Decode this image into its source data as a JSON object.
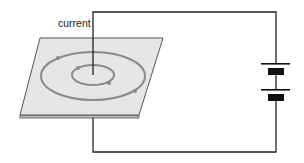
{
  "diagram": {
    "labels": {
      "current": "current"
    },
    "components": {
      "plane": "horizontal card pierced by wire",
      "field_lines": [
        "inner circular field line",
        "outer circular field line"
      ],
      "battery": "two-cell battery"
    },
    "colors": {
      "wire": "#222222",
      "plane_fill": "#e6e6e6",
      "plane_edge": "#555555",
      "field_line": "#8a8a8a",
      "battery_plate": "#111111"
    }
  }
}
